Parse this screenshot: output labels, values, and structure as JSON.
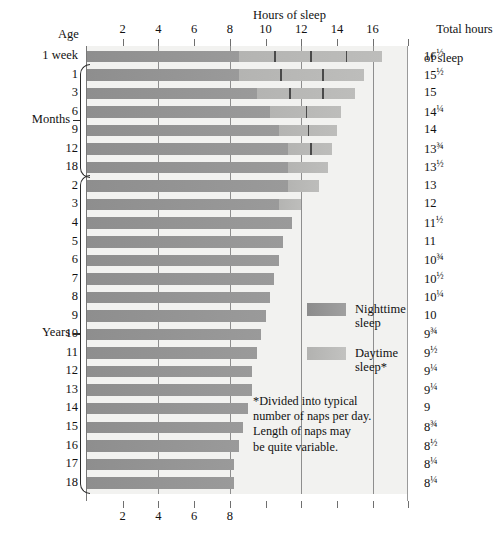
{
  "header": {
    "hours_title": "Hours of sleep",
    "age_title": "Age",
    "total_title_line1": "Total hours",
    "total_title_line2": "of sleep"
  },
  "groups": [
    {
      "label": "Months",
      "first_row": 1,
      "last_row": 6
    },
    {
      "label": "Years",
      "first_row": 7,
      "last_row": 23
    }
  ],
  "legend": {
    "night_label_line1": "Nighttime",
    "night_label_line2": "sleep",
    "day_label_line1": "Daytime",
    "day_label_line2": "sleep*",
    "night_color": "#949494",
    "day_color": "#b9b9b7"
  },
  "footnote": {
    "line1": "*Divided into typical",
    "line2": "number of naps per day.",
    "line3": "Length of naps may",
    "line4": "be quite variable."
  },
  "chart_data": {
    "type": "bar",
    "title": "Hours of sleep",
    "xlabel": "Hours of sleep",
    "ylabel": "Age",
    "xlim": [
      0,
      19
    ],
    "top_ticks": [
      2,
      4,
      6,
      8,
      10,
      12,
      14,
      16,
      18
    ],
    "top_tick_labels": [
      "2",
      "4",
      "6",
      "8",
      "10",
      "12",
      "14",
      "16",
      ""
    ],
    "bottom_ticks": [
      2,
      4,
      6,
      8,
      10,
      12,
      14,
      16,
      18
    ],
    "bottom_tick_labels": [
      "2",
      "4",
      "6",
      "8",
      "",
      "",
      "",
      "",
      ""
    ],
    "gridlines": [
      4,
      8,
      12,
      16
    ],
    "grid": true,
    "legend_position": "inside-right",
    "series": [
      {
        "name": "Nighttime sleep",
        "color": "#949494"
      },
      {
        "name": "Daytime sleep*",
        "color": "#b9b9b7"
      }
    ],
    "categories": [
      "1 week",
      "1",
      "3",
      "6",
      "9",
      "12",
      "18",
      "2",
      "3",
      "4",
      "5",
      "6",
      "7",
      "8",
      "9",
      "10",
      "11",
      "12",
      "13",
      "14",
      "15",
      "16",
      "17",
      "18"
    ],
    "rows": [
      {
        "age": "1 week",
        "group": "",
        "night": 8.5,
        "day": 8.0,
        "total": 16.5,
        "total_label": "16",
        "total_frac": "1/2",
        "naps": 4
      },
      {
        "age": "1",
        "group": "Months",
        "night": 8.5,
        "day": 7.0,
        "total": 15.5,
        "total_label": "15",
        "total_frac": "1/2",
        "naps": 3
      },
      {
        "age": "3",
        "group": "Months",
        "night": 9.5,
        "day": 5.5,
        "total": 15.0,
        "total_label": "15",
        "total_frac": "",
        "naps": 3
      },
      {
        "age": "6",
        "group": "Months",
        "night": 10.25,
        "day": 4.0,
        "total": 14.25,
        "total_label": "14",
        "total_frac": "1/4",
        "naps": 2
      },
      {
        "age": "9",
        "group": "Months",
        "night": 10.75,
        "day": 3.25,
        "total": 14.0,
        "total_label": "14",
        "total_frac": "",
        "naps": 2
      },
      {
        "age": "12",
        "group": "Months",
        "night": 11.25,
        "day": 2.5,
        "total": 13.75,
        "total_label": "13",
        "total_frac": "3/4",
        "naps": 2
      },
      {
        "age": "18",
        "group": "Months",
        "night": 11.25,
        "day": 2.25,
        "total": 13.5,
        "total_label": "13",
        "total_frac": "1/2",
        "naps": 1
      },
      {
        "age": "2",
        "group": "Years",
        "night": 11.25,
        "day": 1.75,
        "total": 13.0,
        "total_label": "13",
        "total_frac": "",
        "naps": 1
      },
      {
        "age": "3",
        "group": "Years",
        "night": 10.75,
        "day": 1.25,
        "total": 12.0,
        "total_label": "12",
        "total_frac": "",
        "naps": 1
      },
      {
        "age": "4",
        "group": "Years",
        "night": 11.5,
        "day": 0,
        "total": 11.5,
        "total_label": "11",
        "total_frac": "1/2",
        "naps": 0
      },
      {
        "age": "5",
        "group": "Years",
        "night": 11.0,
        "day": 0,
        "total": 11.0,
        "total_label": "11",
        "total_frac": "",
        "naps": 0
      },
      {
        "age": "6",
        "group": "Years",
        "night": 10.75,
        "day": 0,
        "total": 10.75,
        "total_label": "10",
        "total_frac": "3/4",
        "naps": 0
      },
      {
        "age": "7",
        "group": "Years",
        "night": 10.5,
        "day": 0,
        "total": 10.5,
        "total_label": "10",
        "total_frac": "1/2",
        "naps": 0
      },
      {
        "age": "8",
        "group": "Years",
        "night": 10.25,
        "day": 0,
        "total": 10.25,
        "total_label": "10",
        "total_frac": "1/4",
        "naps": 0
      },
      {
        "age": "9",
        "group": "Years",
        "night": 10.0,
        "day": 0,
        "total": 10.0,
        "total_label": "10",
        "total_frac": "",
        "naps": 0
      },
      {
        "age": "10",
        "group": "Years",
        "night": 9.75,
        "day": 0,
        "total": 9.75,
        "total_label": "9",
        "total_frac": "3/4",
        "naps": 0
      },
      {
        "age": "11",
        "group": "Years",
        "night": 9.5,
        "day": 0,
        "total": 9.5,
        "total_label": "9",
        "total_frac": "1/2",
        "naps": 0
      },
      {
        "age": "12",
        "group": "Years",
        "night": 9.25,
        "day": 0,
        "total": 9.25,
        "total_label": "9",
        "total_frac": "1/4",
        "naps": 0
      },
      {
        "age": "13",
        "group": "Years",
        "night": 9.25,
        "day": 0,
        "total": 9.25,
        "total_label": "9",
        "total_frac": "1/4",
        "naps": 0
      },
      {
        "age": "14",
        "group": "Years",
        "night": 9.0,
        "day": 0,
        "total": 9.0,
        "total_label": "9",
        "total_frac": "",
        "naps": 0
      },
      {
        "age": "15",
        "group": "Years",
        "night": 8.75,
        "day": 0,
        "total": 8.75,
        "total_label": "8",
        "total_frac": "3/4",
        "naps": 0
      },
      {
        "age": "16",
        "group": "Years",
        "night": 8.5,
        "day": 0,
        "total": 8.5,
        "total_label": "8",
        "total_frac": "1/2",
        "naps": 0
      },
      {
        "age": "17",
        "group": "Years",
        "night": 8.25,
        "day": 0,
        "total": 8.25,
        "total_label": "8",
        "total_frac": "1/4",
        "naps": 0
      },
      {
        "age": "18",
        "group": "Years",
        "night": 8.25,
        "day": 0,
        "total": 8.25,
        "total_label": "8",
        "total_frac": "1/4",
        "naps": 0
      }
    ]
  }
}
